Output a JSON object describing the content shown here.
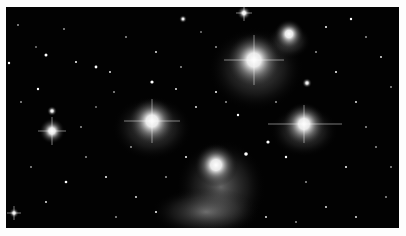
{
  "image": {
    "subject": "Star cluster with reflection nebulosity (open cluster)",
    "alt": "Starfield with several bright blue-white stars surrounded by nebula glow",
    "colors": {
      "background": "#020202",
      "border": "#fdfdfd",
      "star": "#ffffff",
      "nebula": "#bfbfbf"
    }
  },
  "bright_stars": [
    {
      "name": "star-left",
      "x": 46,
      "y": 131,
      "r": 12
    },
    {
      "name": "star-center-left",
      "x": 146,
      "y": 121,
      "r": 22
    },
    {
      "name": "star-top-center",
      "x": 248,
      "y": 60,
      "r": 28
    },
    {
      "name": "star-top-right",
      "x": 283,
      "y": 34,
      "r": 14
    },
    {
      "name": "star-right",
      "x": 298,
      "y": 124,
      "r": 22
    },
    {
      "name": "star-bottom-center",
      "x": 210,
      "y": 165,
      "r": 26
    },
    {
      "name": "star-top-small",
      "x": 238,
      "y": 13,
      "r": 7
    }
  ]
}
